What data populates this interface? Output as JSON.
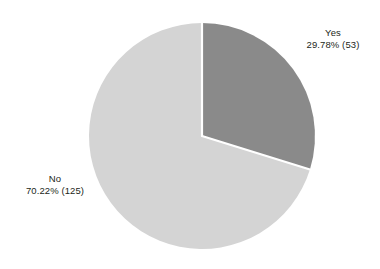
{
  "chart_data": {
    "type": "pie",
    "title": "",
    "subtitle": "",
    "xlabel": "",
    "ylabel": "",
    "legend_position": "none",
    "grid": false,
    "total_count": 178,
    "start_angle_deg": 0,
    "direction": "clockwise",
    "categories": [
      "Yes",
      "No"
    ],
    "values": [
      29.78,
      70.22
    ],
    "counts": [
      53,
      125
    ],
    "colors": [
      "#8a8a8a",
      "#d4d4d4"
    ],
    "separator_color": "#ffffff",
    "background_color": "#ffffff",
    "slices": [
      {
        "name": "Yes",
        "percent": 29.78,
        "count": 53,
        "label_name": "Yes",
        "label_value": "29.78% (53)",
        "color": "#8a8a8a",
        "start_angle_deg": 0,
        "end_angle_deg": 107.2
      },
      {
        "name": "No",
        "percent": 70.22,
        "count": 125,
        "label_name": "No",
        "label_value": "70.22% (125)",
        "color": "#d4d4d4",
        "start_angle_deg": 107.2,
        "end_angle_deg": 360
      }
    ]
  },
  "labels": {
    "yes": {
      "name": "Yes",
      "value": "29.78% (53)"
    },
    "no": {
      "name": "No",
      "value": "70.22% (125)"
    }
  }
}
